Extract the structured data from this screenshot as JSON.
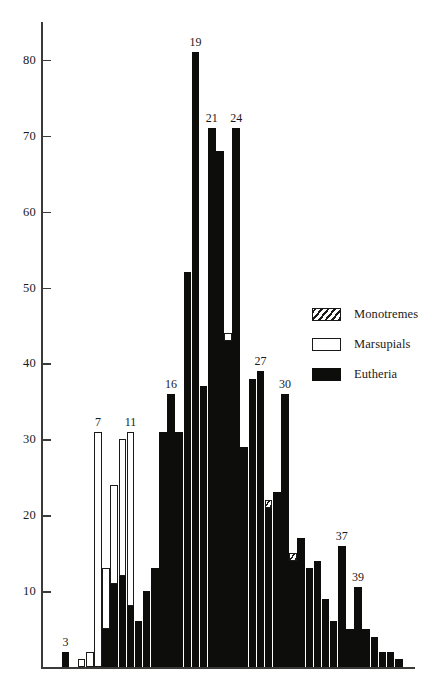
{
  "chart_data": {
    "type": "bar",
    "title": "",
    "subtitle": "",
    "xlabel": "",
    "ylabel": "",
    "grid": false,
    "stacked": true,
    "ylim": [
      0,
      85
    ],
    "yticks": [
      10,
      20,
      30,
      40,
      50,
      60,
      70,
      80
    ],
    "ytick_labels": [
      "10",
      "20",
      "30",
      "40",
      "50",
      "60",
      "70",
      "80"
    ],
    "xlim": [
      0,
      44
    ],
    "xticks": [],
    "xtick_labels": [],
    "legend_position": "right-middle",
    "series": [
      {
        "name": "Monotremes",
        "color": "#ffffff",
        "pattern": "hatched"
      },
      {
        "name": "Marsupials",
        "color": "#ffffff",
        "pattern": "outline"
      },
      {
        "name": "Eutheria",
        "color": "#0d0d0b",
        "pattern": "solid"
      }
    ],
    "categories": [
      "1",
      "2",
      "3",
      "4",
      "5",
      "6",
      "7",
      "8",
      "9",
      "10",
      "11",
      "12",
      "13",
      "14",
      "15",
      "16",
      "17",
      "18",
      "19",
      "20",
      "21",
      "22",
      "23",
      "24",
      "25",
      "26",
      "27",
      "28",
      "29",
      "30",
      "31",
      "32",
      "33",
      "34",
      "35",
      "36",
      "37",
      "38",
      "39",
      "40",
      "41",
      "42",
      "43",
      "44"
    ],
    "bars": [
      {
        "index": 1,
        "monotremes": 0,
        "marsupials": 0,
        "eutheria": 0,
        "label": ""
      },
      {
        "index": 2,
        "monotremes": 0,
        "marsupials": 0,
        "eutheria": 0,
        "label": ""
      },
      {
        "index": 3,
        "monotremes": 0,
        "marsupials": 0,
        "eutheria": 2,
        "label": "3"
      },
      {
        "index": 4,
        "monotremes": 0,
        "marsupials": 0,
        "eutheria": 0,
        "label": ""
      },
      {
        "index": 5,
        "monotremes": 0,
        "marsupials": 1,
        "eutheria": 0,
        "label": ""
      },
      {
        "index": 6,
        "monotremes": 0,
        "marsupials": 2,
        "eutheria": 0,
        "label": ""
      },
      {
        "index": 7,
        "monotremes": 0,
        "marsupials": 31,
        "eutheria": 0,
        "label": "7"
      },
      {
        "index": 8,
        "monotremes": 0,
        "marsupials": 8,
        "eutheria": 5,
        "label": ""
      },
      {
        "index": 9,
        "monotremes": 0,
        "marsupials": 13,
        "eutheria": 11,
        "label": ""
      },
      {
        "index": 10,
        "monotremes": 0,
        "marsupials": 18,
        "eutheria": 12,
        "label": ""
      },
      {
        "index": 11,
        "monotremes": 0,
        "marsupials": 23,
        "eutheria": 8,
        "label": "11"
      },
      {
        "index": 12,
        "monotremes": 0,
        "marsupials": 0,
        "eutheria": 6,
        "label": ""
      },
      {
        "index": 13,
        "monotremes": 0,
        "marsupials": 0,
        "eutheria": 10,
        "label": ""
      },
      {
        "index": 14,
        "monotremes": 0,
        "marsupials": 0,
        "eutheria": 13,
        "label": ""
      },
      {
        "index": 15,
        "monotremes": 0,
        "marsupials": 0,
        "eutheria": 31,
        "label": ""
      },
      {
        "index": 16,
        "monotremes": 0,
        "marsupials": 0,
        "eutheria": 36,
        "label": "16"
      },
      {
        "index": 17,
        "monotremes": 0,
        "marsupials": 0,
        "eutheria": 31,
        "label": ""
      },
      {
        "index": 18,
        "monotremes": 0,
        "marsupials": 0,
        "eutheria": 52,
        "label": ""
      },
      {
        "index": 19,
        "monotremes": 0,
        "marsupials": 0,
        "eutheria": 81,
        "label": "19"
      },
      {
        "index": 20,
        "monotremes": 0,
        "marsupials": 0,
        "eutheria": 37,
        "label": ""
      },
      {
        "index": 21,
        "monotremes": 0,
        "marsupials": 0,
        "eutheria": 71,
        "label": "21"
      },
      {
        "index": 22,
        "monotremes": 0,
        "marsupials": 0,
        "eutheria": 68,
        "label": ""
      },
      {
        "index": 23,
        "monotremes": 0,
        "marsupials": 1,
        "eutheria": 43,
        "label": ""
      },
      {
        "index": 24,
        "monotremes": 0,
        "marsupials": 0,
        "eutheria": 71,
        "label": "24"
      },
      {
        "index": 25,
        "monotremes": 0,
        "marsupials": 0,
        "eutheria": 29,
        "label": ""
      },
      {
        "index": 26,
        "monotremes": 0,
        "marsupials": 0,
        "eutheria": 38,
        "label": ""
      },
      {
        "index": 27,
        "monotremes": 0,
        "marsupials": 0,
        "eutheria": 39,
        "label": "27"
      },
      {
        "index": 28,
        "monotremes": 1,
        "marsupials": 0,
        "eutheria": 21,
        "label": ""
      },
      {
        "index": 29,
        "monotremes": 0,
        "marsupials": 0,
        "eutheria": 23,
        "label": ""
      },
      {
        "index": 30,
        "monotremes": 0,
        "marsupials": 0,
        "eutheria": 36,
        "label": "30"
      },
      {
        "index": 31,
        "monotremes": 1,
        "marsupials": 0,
        "eutheria": 14,
        "label": ""
      },
      {
        "index": 32,
        "monotremes": 0,
        "marsupials": 0,
        "eutheria": 17,
        "label": ""
      },
      {
        "index": 33,
        "monotremes": 0,
        "marsupials": 0,
        "eutheria": 13,
        "label": ""
      },
      {
        "index": 34,
        "monotremes": 0,
        "marsupials": 0,
        "eutheria": 14,
        "label": ""
      },
      {
        "index": 35,
        "monotremes": 0,
        "marsupials": 0,
        "eutheria": 9,
        "label": ""
      },
      {
        "index": 36,
        "monotremes": 0,
        "marsupials": 0,
        "eutheria": 6,
        "label": ""
      },
      {
        "index": 37,
        "monotremes": 0,
        "marsupials": 0,
        "eutheria": 16,
        "label": "37"
      },
      {
        "index": 38,
        "monotremes": 0,
        "marsupials": 0,
        "eutheria": 5,
        "label": ""
      },
      {
        "index": 39,
        "monotremes": 0,
        "marsupials": 0,
        "eutheria": 10.5,
        "label": "39"
      },
      {
        "index": 40,
        "monotremes": 0,
        "marsupials": 0,
        "eutheria": 5,
        "label": ""
      },
      {
        "index": 41,
        "monotremes": 0,
        "marsupials": 0,
        "eutheria": 4,
        "label": ""
      },
      {
        "index": 42,
        "monotremes": 0,
        "marsupials": 0,
        "eutheria": 2,
        "label": ""
      },
      {
        "index": 43,
        "monotremes": 0,
        "marsupials": 0,
        "eutheria": 2,
        "label": ""
      },
      {
        "index": 44,
        "monotremes": 0,
        "marsupials": 0,
        "eutheria": 1,
        "label": ""
      }
    ]
  },
  "legend": {
    "items": [
      {
        "label": "Monotremes",
        "swatch": "hatched-swatch"
      },
      {
        "label": "Marsupials",
        "swatch": "outline-swatch"
      },
      {
        "label": "Eutheria",
        "swatch": "solid-black-swatch"
      }
    ]
  },
  "colors": {
    "eutheria": "#0d0d0b",
    "marsupials": "#ffffff",
    "outline": "#1a1a18",
    "axis": "#3a3a38",
    "background": "#ffffff"
  }
}
